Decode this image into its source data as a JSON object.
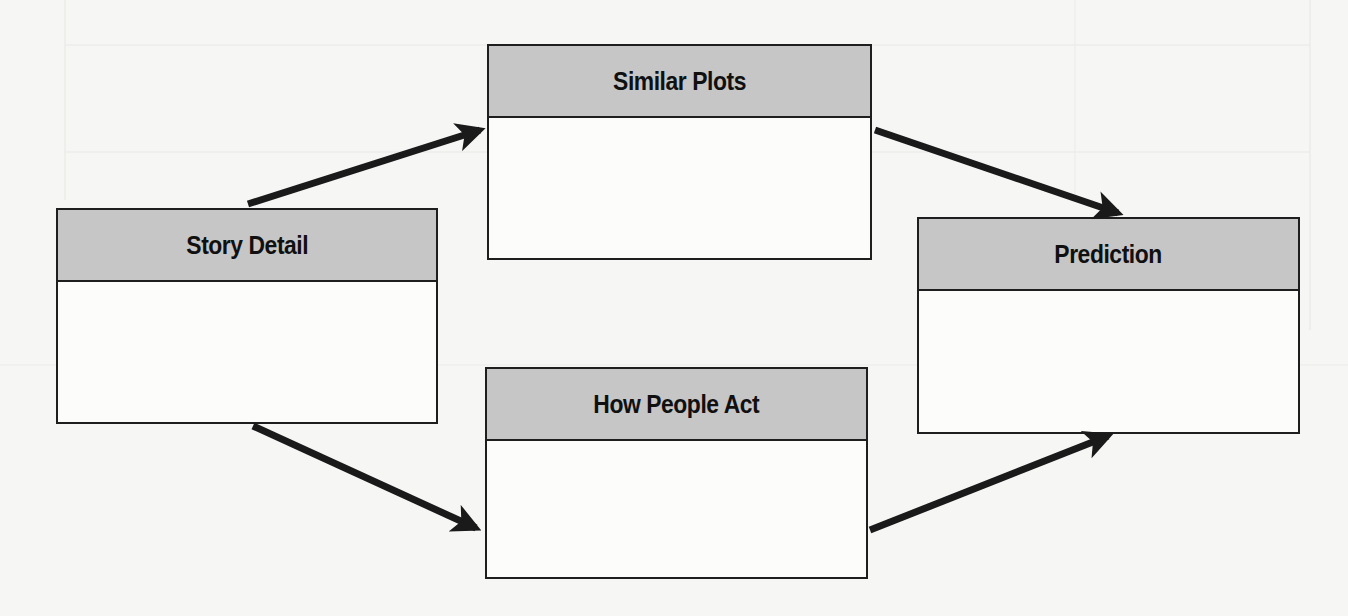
{
  "diagram": {
    "nodes": [
      {
        "id": "story-detail",
        "label": "Story Detail"
      },
      {
        "id": "similar-plots",
        "label": "Similar Plots"
      },
      {
        "id": "how-people-act",
        "label": "How People Act"
      },
      {
        "id": "prediction",
        "label": "Prediction"
      }
    ],
    "edges": [
      {
        "from": "story-detail",
        "to": "similar-plots"
      },
      {
        "from": "story-detail",
        "to": "how-people-act"
      },
      {
        "from": "similar-plots",
        "to": "prediction"
      },
      {
        "from": "how-people-act",
        "to": "prediction"
      }
    ]
  },
  "colors": {
    "header_fill": "#c6c6c6",
    "border": "#1e1e1e",
    "arrow": "#1a1a1a",
    "background": "#f6f6f4"
  }
}
